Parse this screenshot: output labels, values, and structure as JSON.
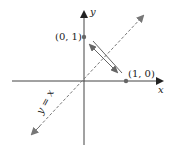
{
  "diagram": {
    "axes": {
      "x_label": "x",
      "y_label": "y"
    },
    "points": [
      {
        "label": "(0, 1)",
        "coords": [
          0,
          1
        ]
      },
      {
        "label": "(1, 0)",
        "coords": [
          1,
          0
        ]
      }
    ],
    "line": {
      "label": "y = x",
      "style": "dashed"
    },
    "reflection_arrow": {
      "description": "double-headed arrow between (0, 1) and (1, 0), perpendicular to y = x"
    },
    "colors": {
      "axis": "#333333",
      "point": "#666666",
      "dashed_line": "#777777",
      "arrow": "#555555"
    }
  }
}
